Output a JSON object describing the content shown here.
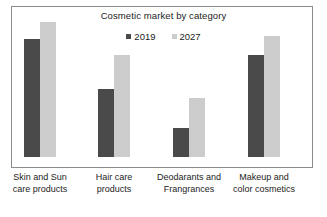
{
  "chart_data": {
    "type": "bar",
    "title": "Cosmetic market by category",
    "xlabel": "",
    "ylabel": "",
    "grid": false,
    "legend_position": "top-center",
    "axis_ticks_visible": false,
    "categories": [
      "Skin and Sun care products",
      "Hair care products",
      "Deodarants and Frangrances",
      "Makeup and color cosmetics"
    ],
    "category_lines": [
      [
        "Skin and Sun",
        "care products"
      ],
      [
        "Hair care",
        "products"
      ],
      [
        "Deodarants and",
        "Frangrances"
      ],
      [
        "Makeup and",
        "color cosmetics"
      ]
    ],
    "series": [
      {
        "name": "2019",
        "color": "#4a4a4a",
        "values": [
          118,
          68,
          29,
          102
        ]
      },
      {
        "name": "2027",
        "color": "#cccccc",
        "values": [
          135,
          102,
          59,
          121
        ]
      }
    ],
    "ylim": [
      0,
      151
    ],
    "units": "relative bar height (px)"
  },
  "legend": {
    "entries": [
      {
        "label": "2019",
        "color": "#4a4a4a"
      },
      {
        "label": "2027",
        "color": "#cccccc"
      }
    ]
  },
  "layout": {
    "frame_border_color": "#8c8c8c",
    "background": "#ffffff",
    "bar_width_px": 16,
    "group_left_px": [
      13,
      87,
      162,
      237
    ],
    "baseline_px": 151
  }
}
